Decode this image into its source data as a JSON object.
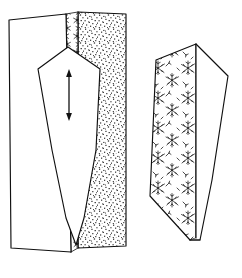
{
  "figure": {
    "title": "Two-panel line drawing of wedge structures",
    "background_color": "#ffffff",
    "ink_color": "#101010",
    "width": 242,
    "height": 278,
    "panels": [
      {
        "id": "left-panel",
        "name": "block-with-stipple-matrix",
        "description": "Rectangular block in oblique view: plain white face at left, a narrow vertical textured seam, and a coarsely stippled face at right. A white wedge with a pointed top and tapering tail overlies the faces, containing a vertical double-headed arrow.",
        "elements": [
          {
            "name": "block-left-face",
            "texture": "blank"
          },
          {
            "name": "block-seam-strip",
            "texture": "dendritic-fine"
          },
          {
            "name": "block-right-face",
            "texture": "stipple-coarse"
          },
          {
            "name": "wedge-outline",
            "texture": "blank"
          },
          {
            "name": "double-headed-arrow",
            "orientation": "vertical",
            "heads": 2
          }
        ]
      },
      {
        "id": "right-panel",
        "name": "isolated-wedge-with-dendritic-texture",
        "description": "An elongated wedge tapering to a point at the bottom, seen in oblique view. Its left facet is filled with branching dendritic marks; its right facet is blank white.",
        "elements": [
          {
            "name": "wedge-left-facet",
            "texture": "dendritic-coarse"
          },
          {
            "name": "wedge-right-facet",
            "texture": "blank"
          },
          {
            "name": "wedge-crest-line",
            "texture": "line"
          }
        ]
      }
    ],
    "textures": {
      "stipple_coarse": {
        "dot_color": "#1c1c1c",
        "density": "high"
      },
      "dendritic": {
        "stroke_color": "#141414",
        "motif": "branching-star"
      }
    },
    "labels": [],
    "caption": ""
  }
}
